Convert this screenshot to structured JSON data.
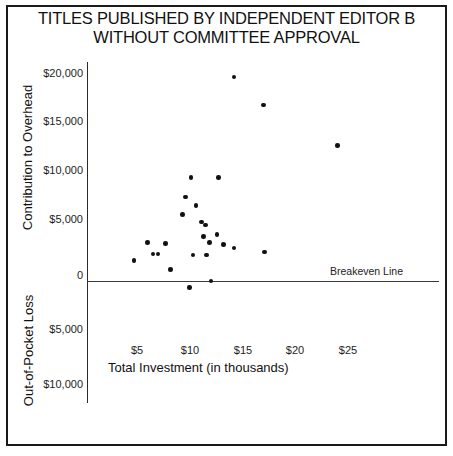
{
  "title": {
    "line1": "TITLES PUBLISHED BY INDEPENDENT EDITOR B",
    "line2": "WITHOUT COMMITTEE APPROVAL"
  },
  "labels": {
    "y_axis_upper": "Contribution to Overhead",
    "y_axis_lower": "Out-of-Pocket Loss",
    "x_axis": "Total Investment (in thousands)",
    "breakeven": "Breakeven Line"
  },
  "ticks": {
    "y": [
      {
        "label": "$20,000",
        "value": 20000,
        "px": 74
      },
      {
        "label": "$15,000",
        "value": 15000,
        "px": 122
      },
      {
        "label": "$10,000",
        "value": 10000,
        "px": 171
      },
      {
        "label": "$5,000",
        "value": 5000,
        "px": 220
      },
      {
        "label": "0",
        "value": 0,
        "px": 276
      },
      {
        "label": "$5,000",
        "value": -5000,
        "px": 330
      },
      {
        "label": "$10,000",
        "value": -10000,
        "px": 385
      }
    ],
    "x": [
      {
        "label": "$5",
        "value": 5,
        "px": 137
      },
      {
        "label": "$10",
        "value": 10,
        "px": 190
      },
      {
        "label": "$15",
        "value": 15,
        "px": 243
      },
      {
        "label": "$20",
        "value": 20,
        "px": 295
      },
      {
        "label": "$25",
        "value": 25,
        "px": 348
      }
    ]
  },
  "colors": {
    "ink": "#111111",
    "frame": "#1a1a1a",
    "axis": "#2b2b2b",
    "point": "#111111"
  },
  "chart_data": {
    "type": "scatter",
    "title": "TITLES PUBLISHED BY INDEPENDENT EDITOR B WITHOUT COMMITTEE APPROVAL",
    "xlabel": "Total Investment (in thousands)",
    "ylabel": "Contribution to Overhead / Out-of-Pocket Loss",
    "xlim": [
      0,
      27
    ],
    "ylim": [
      -11000,
      21500
    ],
    "grid": false,
    "legend": null,
    "annotations": [
      {
        "text": "Breakeven Line",
        "y": 0,
        "type": "horizontal-line"
      }
    ],
    "x_tick_labels": [
      "$5",
      "$10",
      "$15",
      "$20",
      "$25"
    ],
    "y_tick_labels": [
      "$20,000",
      "$15,000",
      "$10,000",
      "$5,000",
      "0",
      "$5,000",
      "$10,000"
    ],
    "points": [
      {
        "x": 4.7,
        "y": 2000
      },
      {
        "x": 6.0,
        "y": 3700
      },
      {
        "x": 6.5,
        "y": 2600
      },
      {
        "x": 7.0,
        "y": 2600
      },
      {
        "x": 7.7,
        "y": 3600
      },
      {
        "x": 8.2,
        "y": 1100
      },
      {
        "x": 9.3,
        "y": 6400
      },
      {
        "x": 9.6,
        "y": 8100
      },
      {
        "x": 10.1,
        "y": 10000
      },
      {
        "x": 10.3,
        "y": 2500
      },
      {
        "x": 10.0,
        "y": -600
      },
      {
        "x": 10.6,
        "y": 7300
      },
      {
        "x": 11.1,
        "y": 5700
      },
      {
        "x": 11.5,
        "y": 5400
      },
      {
        "x": 11.3,
        "y": 4300
      },
      {
        "x": 11.9,
        "y": 3700
      },
      {
        "x": 11.6,
        "y": 2500
      },
      {
        "x": 12.0,
        "y": 0
      },
      {
        "x": 12.6,
        "y": 4500
      },
      {
        "x": 12.7,
        "y": 10000
      },
      {
        "x": 13.2,
        "y": 3500
      },
      {
        "x": 14.2,
        "y": 19700
      },
      {
        "x": 14.2,
        "y": 3200
      },
      {
        "x": 17.0,
        "y": 17000
      },
      {
        "x": 17.1,
        "y": 2800
      },
      {
        "x": 24.0,
        "y": 13100
      }
    ]
  }
}
